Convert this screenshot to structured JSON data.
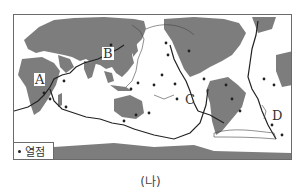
{
  "map": {
    "title": "World map of plate boundaries and hotspots",
    "labels": {
      "A": "A",
      "B": "B",
      "C": "C",
      "D": "D"
    },
    "legend": {
      "hotspot_label": "열점",
      "hotspot_icon": "filled-dot-icon"
    },
    "colors": {
      "land": "#7d7d7d",
      "ocean": "#ffffff",
      "boundary": "#222222",
      "frame": "#6a6a6a"
    }
  },
  "caption": "(나)"
}
